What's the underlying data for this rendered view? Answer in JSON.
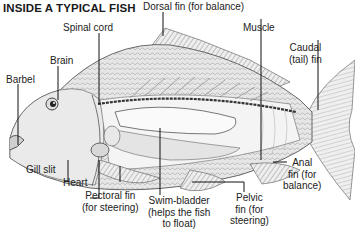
{
  "title": "INSIDE A TYPICAL FISH",
  "labels": {
    "dorsal_fin": "Dorsal fin (for balance)",
    "spinal_cord": "Spinal cord",
    "brain": "Brain",
    "muscle": "Muscle",
    "caudal_fin_line1": "Caudal",
    "caudal_fin_line2": "(tail) fin",
    "barbel": "Barbel",
    "gill_slit": "Gill slit",
    "heart": "Heart",
    "pectoral_fin_line1": "Pectoral fin",
    "pectoral_fin_line2": "(for steering)",
    "swim_bladder_line1": "Swim-bladder",
    "swim_bladder_line2": "(helps the fish",
    "swim_bladder_line3": "to float)",
    "pelvic_fin_line1": "Pelvic",
    "pelvic_fin_line2": "fin (for",
    "pelvic_fin_line3": "steering)",
    "anal_fin_line1": "Anal",
    "anal_fin_line2": "fin (for",
    "anal_fin_line3": "balance)"
  },
  "colors": {
    "ink": "#1a1a1a",
    "body_shade": "#d9d9d9",
    "background": "#ffffff"
  }
}
